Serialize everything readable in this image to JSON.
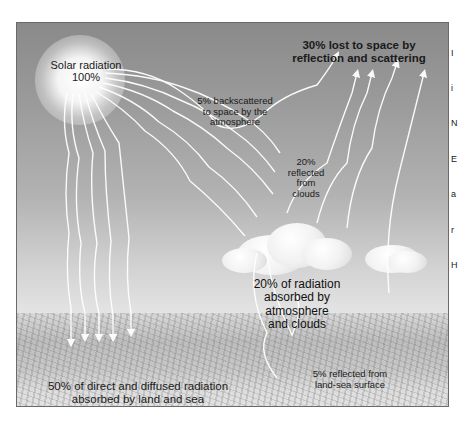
{
  "diagram": {
    "type": "earth-energy-budget",
    "labels": {
      "solar": {
        "line1": "Solar radiation",
        "line2": "100%"
      },
      "lost": {
        "line1": "30% lost to space by",
        "line2": "reflection and scattering"
      },
      "backscattered": {
        "line1": "5% backscattered",
        "line2": "to space by the",
        "line3": "atmosphere"
      },
      "clouds_reflected": {
        "line1": "20%",
        "line2": "reflected",
        "line3": "from",
        "line4": "clouds"
      },
      "absorbed_atmosphere": {
        "line1": "20% of radiation",
        "line2": "absorbed by",
        "line3": "atmosphere",
        "line4": "and clouds"
      },
      "absorbed_land": {
        "line1": "50% of direct and diffused radiation",
        "line2": "absorbed by land and sea"
      },
      "surface_reflected": {
        "line1": "5% reflected from",
        "line2": "land-sea surface"
      }
    },
    "cut_off_text": [
      "I",
      "i",
      "N",
      "E",
      "a",
      "r",
      "H"
    ],
    "colors": {
      "sky_top": "#8a8a8a",
      "sky_bottom": "#e0e0e0",
      "ray": "#ffffff",
      "text": "#1a1a1a",
      "frame": "#6a6a6a"
    }
  }
}
